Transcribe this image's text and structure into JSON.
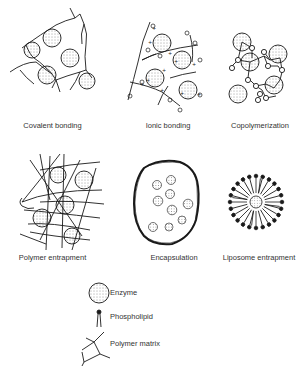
{
  "panels": [
    {
      "id": "covalent",
      "caption": "Covalent bonding"
    },
    {
      "id": "ionic",
      "caption": "Ionic bonding"
    },
    {
      "id": "copolymerization",
      "caption": "Copolymerization"
    },
    {
      "id": "polymer-entrapment",
      "caption": "Polymer entrapment"
    },
    {
      "id": "encapsulation",
      "caption": "Encapsulation"
    },
    {
      "id": "liposome",
      "caption": "Liposome entrapment"
    }
  ],
  "legend": {
    "items": [
      {
        "icon": "enzyme-icon",
        "label": "Enzyme"
      },
      {
        "icon": "phospholipid-icon",
        "label": "Phospholipid"
      },
      {
        "icon": "polymer-matrix-icon",
        "label": "Polymer matrix"
      }
    ]
  },
  "colors": {
    "stroke": "#1a1a1a",
    "background": "#ffffff",
    "text": "#333333"
  }
}
